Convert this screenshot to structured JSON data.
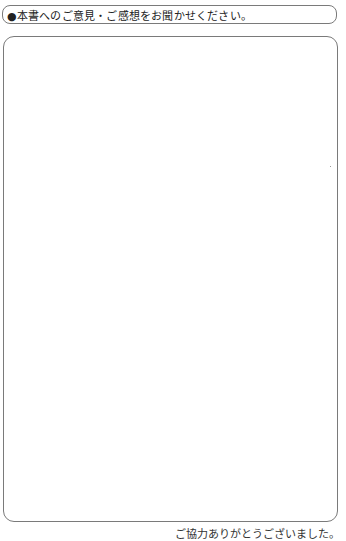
{
  "header": {
    "title": "●本書へのご意見・ご感想をお聞かせください。"
  },
  "comment_box": {
    "content": ""
  },
  "footer": {
    "text": "ご協力ありがとうございました。"
  }
}
